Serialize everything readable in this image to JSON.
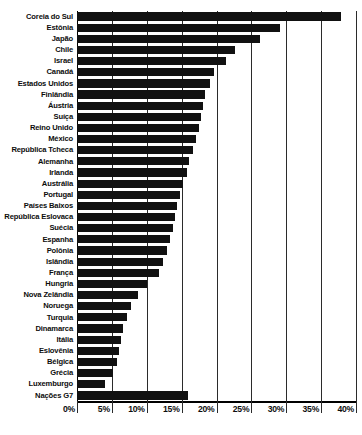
{
  "chart_data": {
    "type": "bar",
    "orientation": "horizontal",
    "title": "",
    "subtitle": "",
    "xlabel": "",
    "ylabel": "",
    "xlim": [
      0,
      40
    ],
    "xunit": "%",
    "grid": true,
    "legend": null,
    "xticks": [
      "0%",
      "5%",
      "10%",
      "15%",
      "20%",
      "25%",
      "30%",
      "35%",
      "40%"
    ],
    "xtick_values": [
      0,
      5,
      10,
      15,
      20,
      25,
      30,
      35,
      40
    ],
    "bar_color": "#111111",
    "categories": [
      "Coreia do Sul",
      "Estônia",
      "Japão",
      "Chile",
      "Israel",
      "Canadá",
      "Estados Unidos",
      "Finlândia",
      "Áustria",
      "Suíça",
      "Reino Unido",
      "México",
      "República Tcheca",
      "Alemanha",
      "Irlanda",
      "Austrália",
      "Portugal",
      "Países Baixos",
      "República Eslovaca",
      "Suécia",
      "Espanha",
      "Polônia",
      "Islândia",
      "França",
      "Hungria",
      "Nova Zelândia",
      "Noruega",
      "Turquia",
      "Dinamarca",
      "Itália",
      "Eslovênia",
      "Bélgica",
      "Grécia",
      "Luxemburgo",
      "Nações G7"
    ],
    "values": [
      37.8,
      29.1,
      26.3,
      22.6,
      21.3,
      19.6,
      19.1,
      18.4,
      18.1,
      17.8,
      17.5,
      17.1,
      16.6,
      16.0,
      15.7,
      15.2,
      14.8,
      14.4,
      14.1,
      13.7,
      13.3,
      12.9,
      12.4,
      11.8,
      10.0,
      8.8,
      7.8,
      7.2,
      6.6,
      6.3,
      6.0,
      5.7,
      5.1,
      4.0,
      15.9
    ],
    "aggregate_index": 34
  }
}
